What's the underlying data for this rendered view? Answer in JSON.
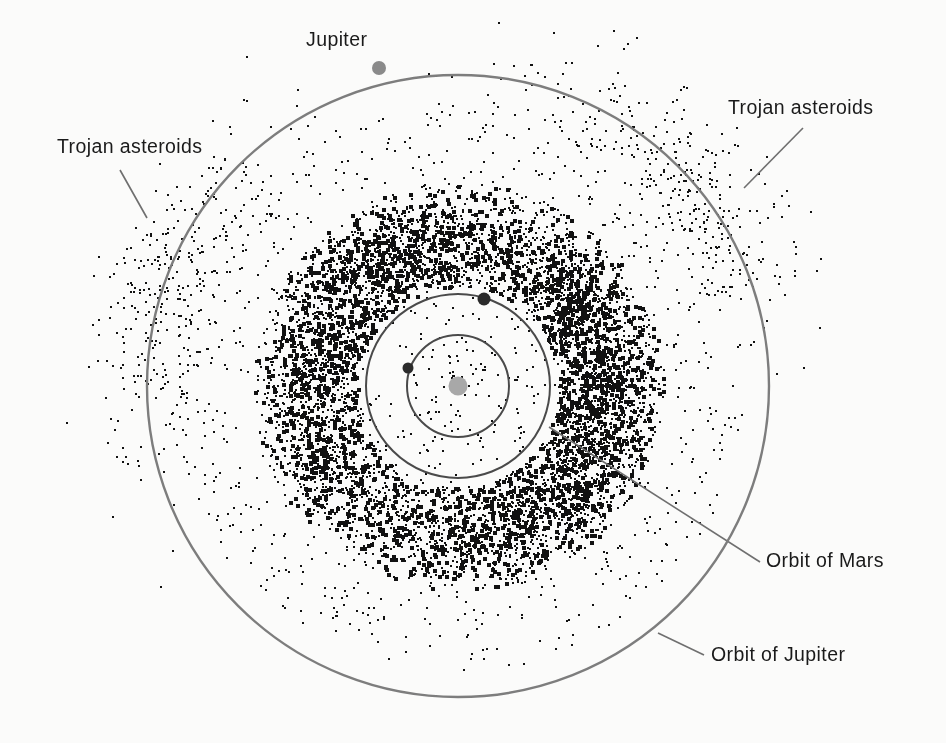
{
  "figure": {
    "kind": "solar-system-asteroid-belt-diagram",
    "background_color": "#fbfbfa",
    "ink_color": "#111111",
    "orbit_line_color": "#7d7d7d",
    "inner_orbit_line_color": "#4a4a4a",
    "sun_color": "#a8a8a8",
    "planet_marker_color": "#8a8a8a",
    "inner_planet_marker_color": "#3a3a3a",
    "center": {
      "x": 458,
      "y": 386
    }
  },
  "labels": {
    "jupiter_planet": "Jupiter",
    "trojan_right": "Trojan asteroids",
    "trojan_left": "Trojan asteroids",
    "orbit_of_mars": "Orbit of Mars",
    "orbit_of_jupiter": "Orbit of Jupiter"
  },
  "chart_data": {
    "type": "scatter",
    "title": "",
    "xlabel": "",
    "ylabel": "",
    "grid": false,
    "legend": "none",
    "projection": "ecliptic-plane top-down view, Sun at center",
    "annotations": [
      {
        "name": "jupiter-planet",
        "text": "Jupiter",
        "text_x": 306,
        "text_y": 28,
        "leader": null
      },
      {
        "name": "trojan-right",
        "text": "Trojan asteroids",
        "text_x": 728,
        "text_y": 96,
        "leader": {
          "x1": 803,
          "y1": 128,
          "x2": 744,
          "y2": 188
        }
      },
      {
        "name": "trojan-left",
        "text": "Trojan asteroids",
        "text_x": 57,
        "text_y": 135,
        "leader": {
          "x1": 120,
          "y1": 170,
          "x2": 147,
          "y2": 218
        }
      },
      {
        "name": "orbit-of-mars",
        "text": "Orbit of Mars",
        "text_x": 766,
        "text_y": 549,
        "leader": {
          "x1": 760,
          "y1": 562,
          "x2": 549,
          "y2": 427
        }
      },
      {
        "name": "orbit-of-jupiter",
        "text": "Orbit of Jupiter",
        "text_x": 711,
        "text_y": 643,
        "leader": {
          "x1": 704,
          "y1": 655,
          "x2": 658,
          "y2": 633
        }
      }
    ],
    "circles": [
      {
        "name": "orbit-of-jupiter",
        "label": "Orbit of Jupiter",
        "radius_px": 311,
        "radius_au": 5.2,
        "stroke": "#7d7d7d",
        "stroke_width": 2.4
      },
      {
        "name": "orbit-of-mars",
        "label": "Orbit of Mars",
        "radius_px": 92,
        "radius_au": 1.52,
        "stroke": "#4a4a4a",
        "stroke_width": 2.0
      },
      {
        "name": "orbit-of-earth",
        "label": "Orbit of Earth",
        "radius_px": 51,
        "radius_au": 1.0,
        "stroke": "#4a4a4a",
        "stroke_width": 2.0
      }
    ],
    "bodies": [
      {
        "name": "sun",
        "x": 458,
        "y": 386,
        "r": 9.5,
        "color": "#a8a8a8"
      },
      {
        "name": "jupiter",
        "x": 379,
        "y": 68,
        "r": 7.0,
        "color": "#8a8a8a",
        "orbit": "orbit-of-jupiter"
      },
      {
        "name": "mars",
        "x": 484,
        "y": 299,
        "r": 6.5,
        "color": "#2b2b2b",
        "orbit": "orbit-of-mars"
      },
      {
        "name": "earth",
        "x": 408,
        "y": 368,
        "r": 5.5,
        "color": "#2b2b2b",
        "orbit": "orbit-of-earth"
      }
    ],
    "populations": [
      {
        "name": "main-belt",
        "label": "Main asteroid belt",
        "count": 9000,
        "inner_radius_px": 100,
        "outer_radius_px": 205,
        "peak_radius_px": 150,
        "radial_sigma_px": 34,
        "dot_size_px": [
          2,
          4
        ]
      },
      {
        "name": "inner-scatter",
        "label": "Near-Earth and Mars-crossing objects",
        "count": 170,
        "inner_radius_px": 6,
        "outer_radius_px": 100,
        "dot_size_px": [
          2,
          3
        ]
      },
      {
        "name": "outer-scatter",
        "label": "Outer main belt / Hilda region",
        "count": 520,
        "inner_radius_px": 205,
        "outer_radius_px": 285,
        "dot_size_px": [
          2,
          3
        ]
      },
      {
        "name": "trojan-leading",
        "label": "Trojan asteroids (L4, leading Jupiter)",
        "count": 330,
        "center_angle_deg": -42,
        "angular_sigma_deg": 17,
        "mean_radius_px": 311,
        "radial_sigma_px": 30,
        "dot_size_px": [
          2,
          3
        ]
      },
      {
        "name": "trojan-trailing",
        "label": "Trojan asteroids (L5, trailing Jupiter)",
        "count": 330,
        "center_angle_deg": 198,
        "angular_sigma_deg": 17,
        "mean_radius_px": 311,
        "radial_sigma_px": 30,
        "dot_size_px": [
          2,
          3
        ]
      }
    ]
  }
}
